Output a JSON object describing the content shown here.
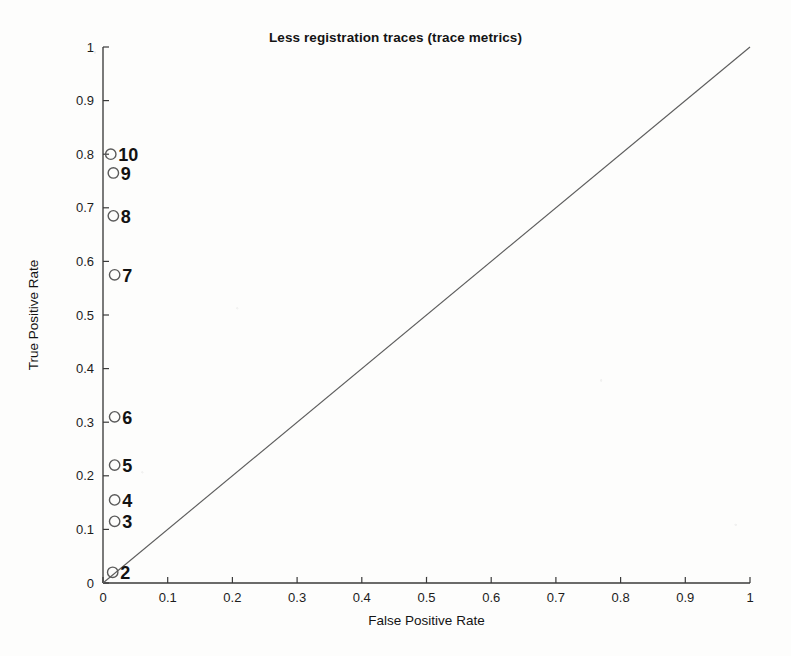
{
  "chart_data": {
    "type": "scatter",
    "title": "Less registration traces (trace metrics)",
    "xlabel": "False Positive Rate",
    "ylabel": "True Positive Rate",
    "xlim": [
      0,
      1
    ],
    "ylim": [
      0,
      1
    ],
    "grid": false,
    "legend": null,
    "xticks": [
      "0",
      "0.1",
      "0.2",
      "0.3",
      "0.4",
      "0.5",
      "0.6",
      "0.7",
      "0.8",
      "0.9",
      "1"
    ],
    "xtick_values": [
      0,
      0.1,
      0.2,
      0.3,
      0.4,
      0.5,
      0.6,
      0.7,
      0.8,
      0.9,
      1
    ],
    "yticks": [
      "0",
      "0.1",
      "0.2",
      "0.3",
      "0.4",
      "0.5",
      "0.6",
      "0.7",
      "0.8",
      "0.9",
      "1"
    ],
    "ytick_values": [
      0,
      0.1,
      0.2,
      0.3,
      0.4,
      0.5,
      0.6,
      0.7,
      0.8,
      0.9,
      1
    ],
    "marker_style": "open-circle",
    "points": [
      {
        "label": "2",
        "x": 0.015,
        "y": 0.02
      },
      {
        "label": "3",
        "x": 0.018,
        "y": 0.115
      },
      {
        "label": "4",
        "x": 0.018,
        "y": 0.155
      },
      {
        "label": "5",
        "x": 0.018,
        "y": 0.22
      },
      {
        "label": "6",
        "x": 0.018,
        "y": 0.31
      },
      {
        "label": "7",
        "x": 0.018,
        "y": 0.575
      },
      {
        "label": "8",
        "x": 0.016,
        "y": 0.685
      },
      {
        "label": "9",
        "x": 0.016,
        "y": 0.765
      },
      {
        "label": "10",
        "x": 0.012,
        "y": 0.8
      }
    ],
    "reference_line": {
      "name": "chance-diagonal",
      "from": [
        0,
        0
      ],
      "to": [
        1,
        1
      ]
    },
    "colors": {
      "axis": "#3a3a3a",
      "marker": "#5a5a5a",
      "diagonal": "#5d5d5d",
      "text": "#141414",
      "background": "#fdfdfc"
    }
  }
}
